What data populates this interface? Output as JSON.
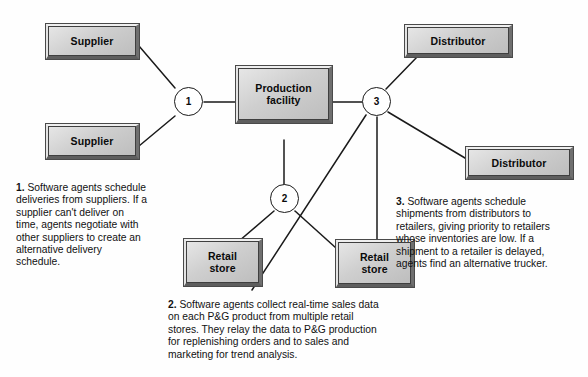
{
  "diagram": {
    "title_visible": false,
    "nodes": [
      {
        "id": "supplier-top",
        "label": "Supplier"
      },
      {
        "id": "supplier-bottom",
        "label": "Supplier"
      },
      {
        "id": "production",
        "label": "Production facility",
        "line1": "Production",
        "line2": "facility"
      },
      {
        "id": "distributor-top",
        "label": "Distributor"
      },
      {
        "id": "distributor-bottom",
        "label": "Distributor"
      },
      {
        "id": "retail-left",
        "label": "Retail store",
        "line1": "Retail",
        "line2": "store"
      },
      {
        "id": "retail-right",
        "label": "Retail store",
        "line1": "Retail",
        "line2": "store"
      }
    ],
    "knots": [
      {
        "id": "knot-1",
        "label": "1"
      },
      {
        "id": "knot-2",
        "label": "2"
      },
      {
        "id": "knot-3",
        "label": "3"
      }
    ],
    "captions": [
      {
        "id": "caption-1",
        "number": "1.",
        "text": "Software agents schedule deliveries from suppliers. If a supplier can't deliver on time, agents negotiate with other suppliers to create an alternative delivery schedule."
      },
      {
        "id": "caption-2",
        "number": "2.",
        "text": "Software agents collect real-time sales data on each P&G product from multiple retail stores. They relay the data to P&G production for replenishing orders and to sales and marketing for trend analysis."
      },
      {
        "id": "caption-3",
        "number": "3.",
        "text": "Software agents schedule shipments from distributors to retailers, giving priority to retailers whose inventories are low. If a shipment to a retailer is delayed, agents find an alternative trucker."
      }
    ],
    "colors": {
      "box_fill_light": "#e7e7e7",
      "box_fill_dark": "#bdbdbd",
      "box_outline": "#3f3f3f",
      "connector": "#1a1a1a",
      "circle_fill": "#ffffff",
      "text": "#111111",
      "background": "#fefefe"
    }
  }
}
